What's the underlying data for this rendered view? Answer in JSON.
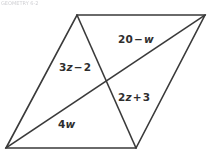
{
  "figure": {
    "title_strip": "GEOMETRY 6-2",
    "watermark": "",
    "shape_name": "parallelogram-with-diagonals",
    "background_color": "#ffffff",
    "stroke_color": "#3a3a3a",
    "text_color": "#2e2e2e",
    "vertices": {
      "bottom_left": {
        "x": 6,
        "y": 148
      },
      "top_left": {
        "x": 77,
        "y": 15
      },
      "top_right": {
        "x": 205,
        "y": 15
      },
      "bottom_right": {
        "x": 136,
        "y": 148
      }
    },
    "diagonal_intersection": {
      "x": 105,
      "y": 80
    },
    "outline_path": "M 6 148 L 77 15 L 205 15 L 136 148 Z",
    "diagonals": [
      {
        "name": "diagonal-top-left-to-bottom-right",
        "from": "top_left",
        "to": "bottom_right",
        "path": "M 77 15 L 136 148"
      },
      {
        "name": "diagonal-bottom-left-to-top-right",
        "from": "bottom_left",
        "to": "top_right",
        "path": "M 6 148 L 205 15"
      }
    ],
    "segment_labels": [
      {
        "id": "label-3z-2",
        "name": "segment-label-3z-minus-2",
        "coefficient": "3",
        "variable": "z",
        "operator": "−",
        "constant": "2",
        "text": "3z − 2",
        "describes": "upper half of diagonal from top-left vertex to intersection"
      },
      {
        "id": "label-20-w",
        "name": "segment-label-20-minus-w",
        "coefficient": "20",
        "variable": "w",
        "operator": "−",
        "constant": "",
        "text": "20 − w",
        "describes": "upper-right half of diagonal from intersection to top-right vertex"
      },
      {
        "id": "label-2z-3",
        "name": "segment-label-2z-plus-3",
        "coefficient": "2",
        "variable": "z",
        "operator": "+",
        "constant": "3",
        "text": "2z + 3",
        "describes": "lower half of diagonal from intersection to bottom-right vertex"
      },
      {
        "id": "label-4w",
        "name": "segment-label-4w",
        "coefficient": "4",
        "variable": "w",
        "operator": "",
        "constant": "",
        "text": "4w",
        "describes": "lower-left half of diagonal from bottom-left vertex to intersection"
      }
    ]
  }
}
